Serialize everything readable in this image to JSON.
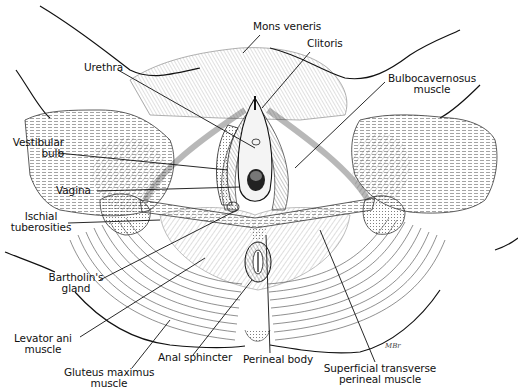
{
  "figure": {
    "signature": "MBr"
  },
  "labels": {
    "mons_veneris": "Mons veneris",
    "clitoris": "Clitoris",
    "urethra": "Urethra",
    "bulbocavernosus_line1": "Bulbocavernosus",
    "bulbocavernosus_line2": "muscle",
    "vestibular_bulb_line1": "Vestibular",
    "vestibular_bulb_line2": "bulb",
    "vagina": "Vagina",
    "ischial_line1": "Ischial",
    "ischial_line2": "tuberosities",
    "bartholin_line1": "Bartholin's",
    "bartholin_line2": "gland",
    "levator_line1": "Levator ani",
    "levator_line2": "muscle",
    "gluteus_line1": "Gluteus maximus",
    "gluteus_line2": "muscle",
    "anal_sphincter": "Anal sphincter",
    "perineal_body": "Perineal body",
    "superficial_line1": "Superficial transverse",
    "superficial_line2": "perineal muscle"
  },
  "colors": {
    "ink": "#111111",
    "shade": "#555555",
    "paper": "#ffffff"
  }
}
